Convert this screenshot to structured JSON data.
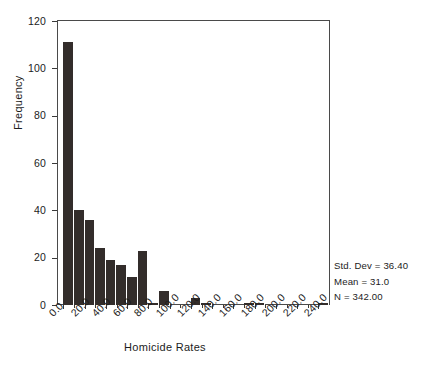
{
  "chart_data": {
    "type": "bar",
    "subtype": "histogram",
    "title": "",
    "xlabel": "Homicide Rates",
    "ylabel": "Frequency",
    "xlim": [
      -5,
      250
    ],
    "ylim": [
      0,
      120
    ],
    "grid": false,
    "legend": null,
    "bin_width": 10,
    "y_ticks": [
      0,
      20,
      40,
      60,
      80,
      100,
      120
    ],
    "y_tick_labels": [
      "0",
      "20",
      "40",
      "60",
      "80",
      "100",
      "120"
    ],
    "x_ticks": [
      0,
      20,
      40,
      60,
      80,
      100,
      120,
      140,
      160,
      180,
      200,
      220,
      240
    ],
    "x_tick_labels": [
      "0.0",
      "20.0",
      "40.0",
      "60.0",
      "80.0",
      "100.0",
      "120.0",
      "140.0",
      "160.0",
      "180.0",
      "200.0",
      "220.0",
      "240.0"
    ],
    "bin_starts": [
      0,
      10,
      20,
      30,
      40,
      50,
      60,
      70,
      80,
      90,
      100,
      110,
      120,
      130,
      140,
      150,
      160,
      170,
      180,
      190,
      200,
      210,
      220,
      230,
      240
    ],
    "values": [
      111,
      40,
      36,
      24,
      19,
      17,
      12,
      23,
      1,
      6,
      0,
      0,
      3,
      1,
      0,
      0,
      0,
      1,
      1,
      0,
      0,
      0,
      0,
      0,
      1
    ],
    "bar_color": "#332d2b",
    "axis_color": "#4a4a4a",
    "background_color": "#ffffff"
  },
  "annotations": {
    "std_dev": "Std. Dev = 36.40",
    "mean": "Mean = 31.0",
    "n": "N = 342.00"
  }
}
